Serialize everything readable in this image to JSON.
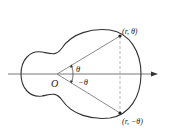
{
  "figure": {
    "origin_label": "O",
    "point_upper_label": "(r, θ)",
    "point_lower_label": "(r, −θ)",
    "angle_upper_label": "θ",
    "angle_lower_label": "−θ"
  },
  "colors": {
    "curve": "#333333",
    "rays": "#8a8a8a",
    "axis": "#555555",
    "dashed": "#999999",
    "text": "#222222"
  }
}
